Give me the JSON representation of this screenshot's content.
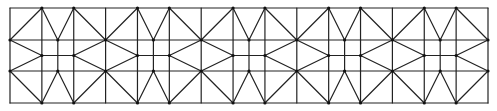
{
  "diagram": {
    "type": "geometric-tessellation",
    "frame": {
      "x": 10,
      "y": 8,
      "width": 478,
      "height": 95
    },
    "columns": 15,
    "column_width": 31.87,
    "periods": 5,
    "rows_y": [
      8,
      40,
      55.5,
      71,
      103
    ],
    "stroke_color": "#222222",
    "background": "#ffffff"
  }
}
